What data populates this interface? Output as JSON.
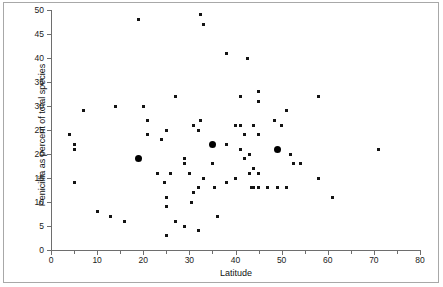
{
  "figure": {
    "width": 443,
    "height": 287,
    "border_color": "#a8a8a8",
    "background": "#ffffff"
  },
  "chart_data": {
    "type": "scatter",
    "title": "",
    "xlabel": "Latitude",
    "ylabel": "Penicillia as percent of total species",
    "xlim": [
      0,
      80
    ],
    "ylim": [
      0,
      50
    ],
    "xticks": [
      0,
      10,
      20,
      30,
      40,
      50,
      60,
      70,
      80
    ],
    "xticklabels": [
      "0",
      "10",
      "20",
      "30",
      "40",
      "50",
      "60",
      "70",
      "80"
    ],
    "xminorticks": [
      5,
      15,
      25,
      35,
      45,
      55,
      65,
      75
    ],
    "yticks": [
      0,
      5,
      10,
      15,
      20,
      25,
      30,
      35,
      40,
      45,
      50
    ],
    "yticklabels": [
      "0",
      "5",
      "10",
      "15",
      "20",
      "25",
      "30",
      "35",
      "40",
      "45",
      "50"
    ],
    "grid": false,
    "legend": false,
    "marker_color": "#141414",
    "series": [
      {
        "name": "samples",
        "marker": "square-small",
        "points": [
          [
            4,
            24
          ],
          [
            5,
            22
          ],
          [
            5,
            21
          ],
          [
            5,
            14
          ],
          [
            7,
            29
          ],
          [
            10,
            8
          ],
          [
            13,
            7
          ],
          [
            14,
            30
          ],
          [
            16,
            6
          ],
          [
            19,
            48
          ],
          [
            20,
            30
          ],
          [
            21,
            27
          ],
          [
            21,
            24
          ],
          [
            23,
            16
          ],
          [
            24,
            23
          ],
          [
            24.5,
            14
          ],
          [
            25,
            25
          ],
          [
            25,
            11
          ],
          [
            25,
            9
          ],
          [
            25,
            3
          ],
          [
            26,
            16
          ],
          [
            27,
            32
          ],
          [
            27,
            6
          ],
          [
            29,
            19
          ],
          [
            29,
            18
          ],
          [
            29,
            5
          ],
          [
            30,
            16
          ],
          [
            30.5,
            10
          ],
          [
            31,
            26
          ],
          [
            31,
            12
          ],
          [
            32,
            25
          ],
          [
            32,
            13
          ],
          [
            32,
            4
          ],
          [
            32.5,
            49
          ],
          [
            32.5,
            27
          ],
          [
            33,
            47
          ],
          [
            33,
            15
          ],
          [
            35,
            18
          ],
          [
            35.5,
            13
          ],
          [
            36,
            7
          ],
          [
            38,
            41
          ],
          [
            38,
            22
          ],
          [
            38,
            14
          ],
          [
            40,
            26
          ],
          [
            40,
            15
          ],
          [
            41,
            32
          ],
          [
            41,
            26
          ],
          [
            41,
            21
          ],
          [
            42,
            24
          ],
          [
            42,
            19
          ],
          [
            42.5,
            40
          ],
          [
            43,
            20
          ],
          [
            43,
            16
          ],
          [
            43.5,
            13
          ],
          [
            44,
            26
          ],
          [
            44,
            17
          ],
          [
            44,
            13
          ],
          [
            45,
            33
          ],
          [
            45,
            31
          ],
          [
            45,
            24
          ],
          [
            45,
            16
          ],
          [
            45,
            13
          ],
          [
            47,
            13
          ],
          [
            48.5,
            27
          ],
          [
            49,
            13
          ],
          [
            50,
            26
          ],
          [
            51,
            29
          ],
          [
            51,
            13
          ],
          [
            52,
            20
          ],
          [
            52.5,
            18
          ],
          [
            54,
            18
          ],
          [
            58,
            32
          ],
          [
            58,
            15
          ],
          [
            61,
            11
          ],
          [
            71,
            21
          ]
        ]
      },
      {
        "name": "highlighted-means",
        "marker": "circle-large",
        "points": [
          [
            19,
            19
          ],
          [
            35,
            22
          ],
          [
            49,
            21
          ]
        ]
      }
    ]
  }
}
